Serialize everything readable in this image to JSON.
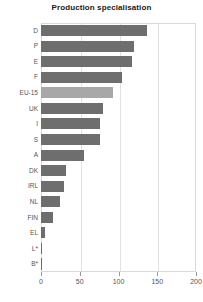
{
  "chart_data": {
    "type": "bar",
    "orientation": "horizontal",
    "title": "Production specialisation",
    "xlabel": "",
    "ylabel": "",
    "xlim": [
      0,
      200
    ],
    "xticks": [
      0,
      50,
      100,
      150,
      200
    ],
    "grid": true,
    "legend": "none",
    "highlight_category": "EU-15",
    "colors": {
      "bar": "#6e6e6e",
      "highlight_bar": "#a8a8a8",
      "frame": "#d9d9d9",
      "grid": "#e2e2e2",
      "text": "#555555",
      "title": "#1a1a1a"
    },
    "categories": [
      "D",
      "P",
      "E",
      "F",
      "EU-15",
      "UK",
      "I",
      "S",
      "A",
      "DK",
      "IRL",
      "NL",
      "FIN",
      "EL",
      "L*",
      "B*"
    ],
    "values": [
      137,
      120,
      117,
      104,
      93,
      80,
      76,
      76,
      55,
      32,
      30,
      24,
      15,
      5,
      1,
      1
    ]
  }
}
